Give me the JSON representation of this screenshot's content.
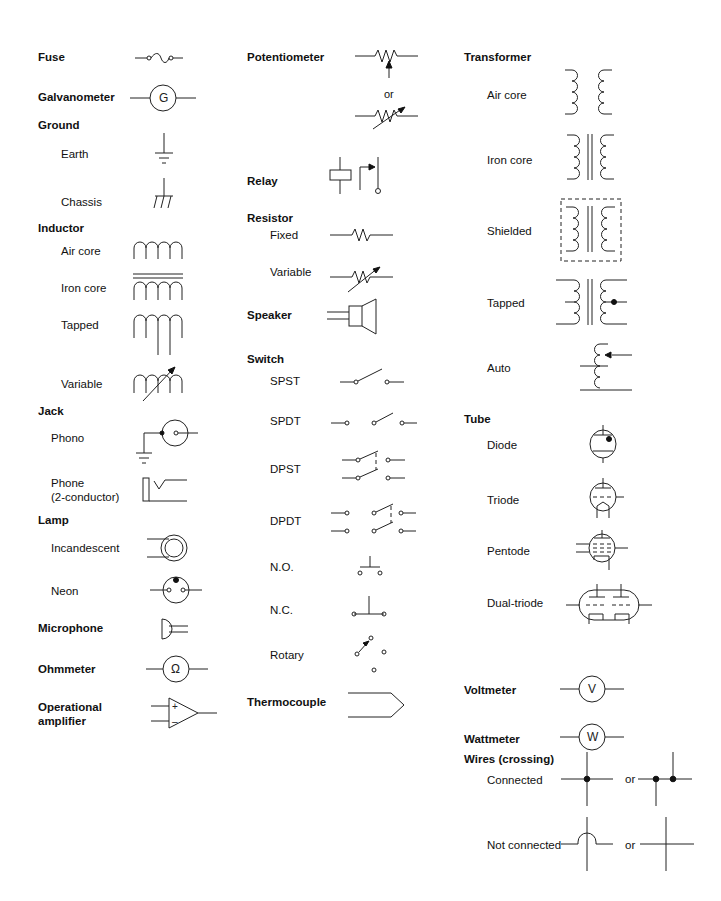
{
  "col1": {
    "fuse": "Fuse",
    "galvanometer": "Galvanometer",
    "galvanometer_letter": "G",
    "ground": "Ground",
    "ground_earth": "Earth",
    "ground_chassis": "Chassis",
    "inductor": "Inductor",
    "inductor_air": "Air core",
    "inductor_iron": "Iron core",
    "inductor_tapped": "Tapped",
    "inductor_variable": "Variable",
    "jack": "Jack",
    "jack_phono": "Phono",
    "jack_phone": "Phone\n(2-conductor)",
    "lamp": "Lamp",
    "lamp_incandescent": "Incandescent",
    "lamp_neon": "Neon",
    "microphone": "Microphone",
    "ohmmeter": "Ohmmeter",
    "ohmmeter_letter": "Ω",
    "opamp": "Operational\namplifier",
    "opamp_plus": "+",
    "opamp_minus": "–"
  },
  "col2": {
    "potentiometer": "Potentiometer",
    "potentiometer_or": "or",
    "relay": "Relay",
    "resistor": "Resistor",
    "resistor_fixed": "Fixed",
    "resistor_variable": "Variable",
    "speaker": "Speaker",
    "switch": "Switch",
    "switch_spst": "SPST",
    "switch_spdt": "SPDT",
    "switch_dpst": "DPST",
    "switch_dpdt": "DPDT",
    "switch_no": "N.O.",
    "switch_nc": "N.C.",
    "switch_rotary": "Rotary",
    "thermocouple": "Thermocouple"
  },
  "col3": {
    "transformer": "Transformer",
    "transformer_air": "Air core",
    "transformer_iron": "Iron core",
    "transformer_shielded": "Shielded",
    "transformer_tapped": "Tapped",
    "transformer_auto": "Auto",
    "tube": "Tube",
    "tube_diode": "Diode",
    "tube_triode": "Triode",
    "tube_pentode": "Pentode",
    "tube_dual": "Dual-triode",
    "voltmeter": "Voltmeter",
    "voltmeter_letter": "V",
    "wattmeter": "Wattmeter",
    "wattmeter_letter": "W",
    "wires": "Wires (crossing)",
    "wires_connected": "Connected",
    "wires_not_connected": "Not connected",
    "wires_or": "or"
  }
}
